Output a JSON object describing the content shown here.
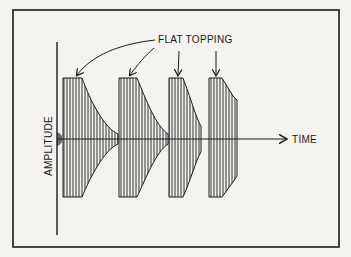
{
  "diagram": {
    "annotation_label": "FLAT TOPPING",
    "x_axis_label": "TIME",
    "y_axis_label": "AMPLITUDE",
    "colors": {
      "ink": "#1a1a1a",
      "paper": "#f4f3f0"
    },
    "bursts": [
      {
        "name": "burst-1",
        "flat_start": 63,
        "flat_end": 82,
        "decay_end": 118
      },
      {
        "name": "burst-2",
        "flat_start": 119,
        "flat_end": 137,
        "decay_end": 168
      },
      {
        "name": "burst-3",
        "flat_start": 169,
        "flat_end": 183,
        "decay_end": 201
      },
      {
        "name": "burst-4",
        "flat_start": 209,
        "flat_end": 222,
        "decay_end": 237
      }
    ]
  }
}
